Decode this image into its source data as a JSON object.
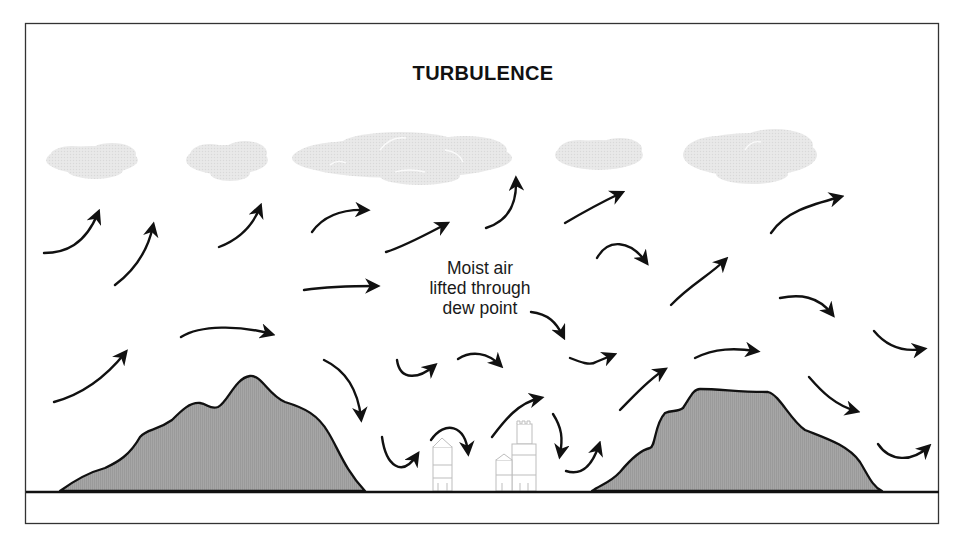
{
  "diagram": {
    "title": "TURBULENCE",
    "annotation": {
      "lines": [
        "Moist air",
        "lifted through",
        "dew point"
      ]
    },
    "colors": {
      "frame": "#333333",
      "ground_line": "#111111",
      "mountain_fill": "#a3a3a3",
      "mountain_stroke": "#111111",
      "cloud_fill": "#e6e6e6",
      "arrow": "#111111",
      "building_stroke": "#bdbdbd"
    },
    "elements": {
      "clouds": 6,
      "mountains": 2,
      "buildings": 2,
      "airflow_arrows": 30
    }
  }
}
